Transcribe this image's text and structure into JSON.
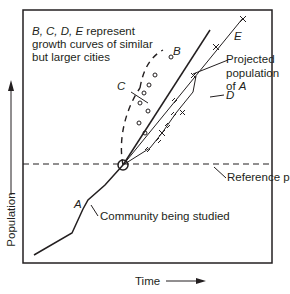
{
  "figure": {
    "legend_note_line1_italic": "B, C, D, E",
    "legend_note_line1_rest": " represent",
    "legend_note_line2": "growth curves of similar",
    "legend_note_line3": "but larger cities",
    "y_axis_label": "Population",
    "x_axis_label": "Time",
    "reference_label": "Reference population",
    "community_label": "Community being studied",
    "projected_line1": "Projected",
    "projected_line2": "population",
    "projected_line3_prefix": "of ",
    "projected_line3_italic": "A",
    "curve_labels": {
      "A": "A",
      "B": "B",
      "C": "C",
      "D": "D",
      "E": "E"
    },
    "colors": {
      "ink": "#231f20",
      "background": "#ffffff"
    }
  }
}
